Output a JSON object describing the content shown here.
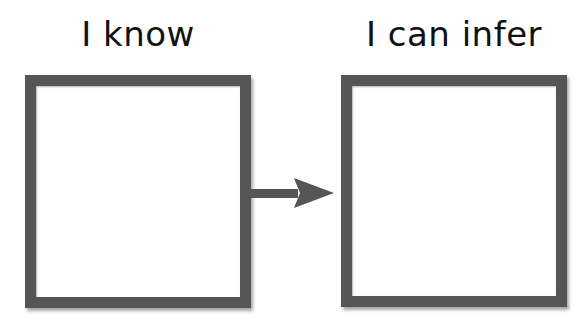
{
  "diagram": {
    "left": {
      "label": "I know"
    },
    "right": {
      "label": "I can infer"
    },
    "connector": {
      "type": "arrow",
      "direction": "right"
    },
    "colors": {
      "border": "#555555",
      "text": "#111111",
      "background": "#ffffff"
    }
  }
}
